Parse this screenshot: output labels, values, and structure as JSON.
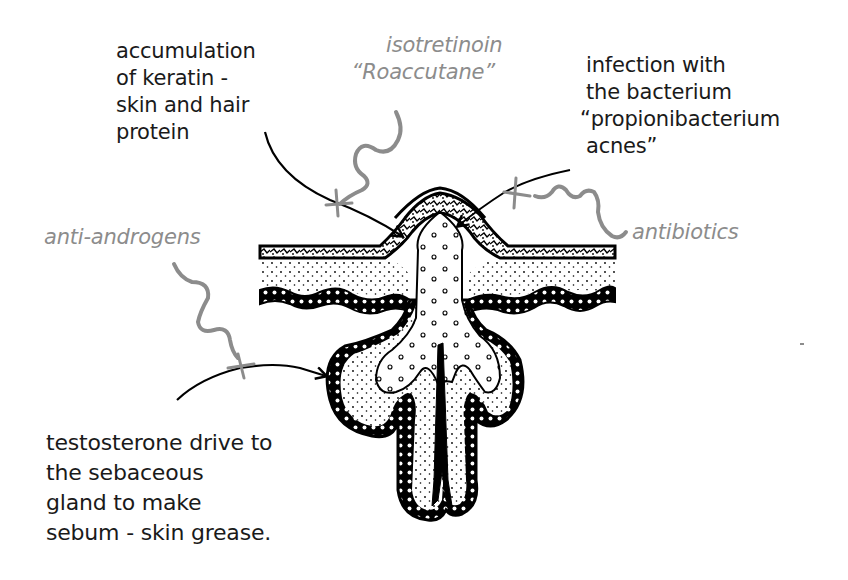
{
  "diagram": {
    "colors": {
      "cause_text": "#1a1a1a",
      "treatment_text": "#8c8c8c",
      "treatment_line": "#8c8c8c",
      "ink": "#000000",
      "background": "#ffffff"
    }
  },
  "causes": {
    "keratin": {
      "lines": [
        "accumulation",
        "of keratin -",
        "skin and hair",
        "protein"
      ]
    },
    "bacteria": {
      "lines": [
        "infection with",
        "the bacterium",
        "“propionibacterium",
        "acnes”"
      ]
    },
    "testosterone": {
      "lines": [
        "testosterone drive to",
        "the sebaceous",
        "gland to make",
        "sebum - skin grease."
      ]
    }
  },
  "treatments": {
    "isotretinoin": {
      "lines": [
        "isotretinoin",
        "“Roaccutane”"
      ],
      "blocks": "keratin"
    },
    "antibiotics": {
      "lines": [
        "antibiotics"
      ],
      "blocks": "bacteria"
    },
    "anti_androgens": {
      "lines": [
        "anti-androgens"
      ],
      "blocks": "testosterone"
    }
  }
}
